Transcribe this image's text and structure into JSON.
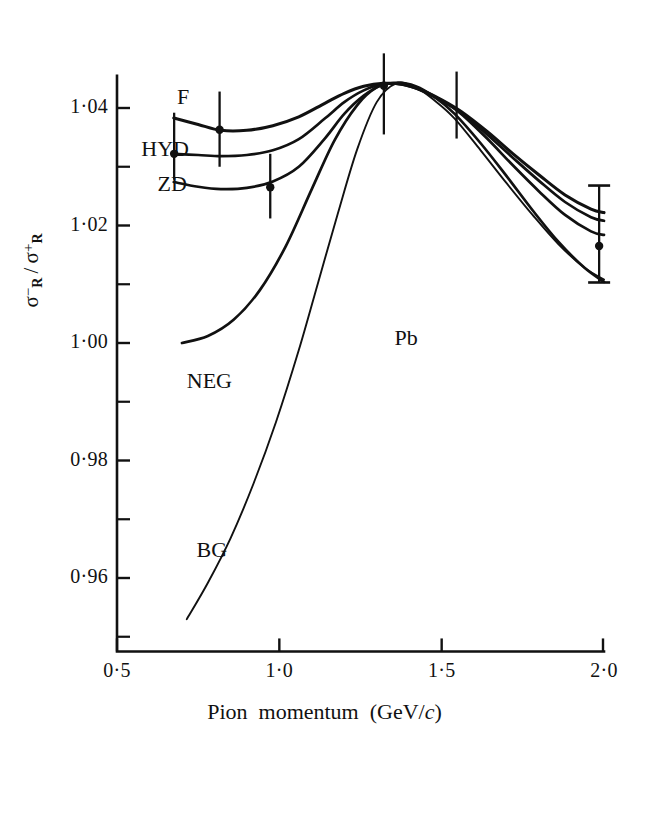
{
  "figure": {
    "target_label": "Pb",
    "y_axis_title_html": "σ⁻_R / σ⁺_R",
    "x_axis_title": "Pion momentum (GeV/c)"
  },
  "chart_data": {
    "type": "line",
    "title": "",
    "subtitle": "",
    "xlabel": "Pion momentum (GeV/c)",
    "ylabel": "σᴿ⁻ / σᴿ⁺",
    "xlim": [
      0.5,
      2.0
    ],
    "ylim": [
      0.9475,
      1.0455
    ],
    "grid": false,
    "legend": "inline-curve-labels",
    "annotations": [
      {
        "text": "Pb",
        "x": 1.355,
        "y": 1.0005
      },
      {
        "text": "F",
        "x": 0.685,
        "y": 1.0415
      },
      {
        "text": "HYD",
        "x": 0.575,
        "y": 1.0326
      },
      {
        "text": "ZD",
        "x": 0.625,
        "y": 1.0268
      },
      {
        "text": "NEG",
        "x": 0.715,
        "y": 0.9932
      },
      {
        "text": "BG",
        "x": 0.745,
        "y": 0.9645
      }
    ],
    "x_ticks": [
      0.5,
      1.0,
      1.5,
      2.0
    ],
    "x_ticklabels": [
      "0·5",
      "1·0",
      "1·5",
      "2·0"
    ],
    "x_minor_ticks": [
      0.75,
      1.25,
      1.75
    ],
    "y_ticks": [
      0.96,
      0.98,
      1.0,
      1.02,
      1.04
    ],
    "y_ticklabels": [
      "0·96",
      "0·98",
      "1·00",
      "1·02",
      "1·04"
    ],
    "y_minor_ticks": [
      0.95,
      0.97,
      0.99,
      1.01,
      1.03
    ],
    "series": [
      {
        "name": "F",
        "style": "solid-heavy",
        "x": [
          0.675,
          0.75,
          0.82,
          0.9,
          0.98,
          1.06,
          1.14,
          1.2,
          1.26,
          1.32,
          1.38,
          1.44,
          1.5,
          1.56,
          1.64,
          1.72,
          1.8,
          1.88,
          1.96,
          2.0
        ],
        "y": [
          1.0383,
          1.0372,
          1.0362,
          1.0362,
          1.037,
          1.0385,
          1.0408,
          1.0425,
          1.0437,
          1.0442,
          1.044,
          1.043,
          1.0414,
          1.0394,
          1.036,
          1.0322,
          1.0286,
          1.0252,
          1.0228,
          1.0222
        ]
      },
      {
        "name": "HYD",
        "style": "solid-med",
        "x": [
          0.675,
          0.75,
          0.82,
          0.9,
          0.98,
          1.06,
          1.14,
          1.2,
          1.26,
          1.32,
          1.38,
          1.44,
          1.5,
          1.56,
          1.64,
          1.72,
          1.8,
          1.88,
          1.96,
          2.0
        ],
        "y": [
          1.0322,
          1.032,
          1.0318,
          1.032,
          1.0328,
          1.0347,
          1.0382,
          1.041,
          1.043,
          1.0441,
          1.044,
          1.0429,
          1.0412,
          1.0392,
          1.0355,
          1.0315,
          1.0276,
          1.024,
          1.0214,
          1.0208
        ]
      },
      {
        "name": "ZD",
        "style": "solid-med",
        "x": [
          0.675,
          0.75,
          0.82,
          0.9,
          0.98,
          1.06,
          1.14,
          1.2,
          1.26,
          1.32,
          1.38,
          1.44,
          1.5,
          1.56,
          1.64,
          1.72,
          1.8,
          1.88,
          1.96,
          2.0
        ],
        "y": [
          1.0274,
          1.0266,
          1.0262,
          1.0264,
          1.0275,
          1.03,
          1.0348,
          1.039,
          1.0421,
          1.044,
          1.0441,
          1.043,
          1.0413,
          1.039,
          1.0348,
          1.0302,
          1.0258,
          1.0218,
          1.019,
          1.0184
        ]
      },
      {
        "name": "NEG",
        "style": "solid-med",
        "x": [
          0.7,
          0.78,
          0.86,
          0.94,
          1.02,
          1.1,
          1.17,
          1.24,
          1.3,
          1.36,
          1.42,
          1.48,
          1.54,
          1.62,
          1.7,
          1.78,
          1.86,
          1.94,
          2.0
        ],
        "y": [
          1.0,
          1.0012,
          1.004,
          1.009,
          1.0165,
          1.0262,
          1.0345,
          1.0405,
          1.0435,
          1.0443,
          1.0437,
          1.0418,
          1.039,
          1.034,
          1.0284,
          1.0226,
          1.0172,
          1.0128,
          1.0104
        ]
      },
      {
        "name": "BG",
        "style": "solid-thin",
        "x": [
          0.715,
          0.78,
          0.85,
          0.92,
          0.99,
          1.06,
          1.12,
          1.18,
          1.24,
          1.3,
          1.36,
          1.42,
          1.48,
          1.54,
          1.62,
          1.7,
          1.78,
          1.86,
          1.94,
          2.0
        ],
        "y": [
          0.953,
          0.9592,
          0.9668,
          0.976,
          0.9866,
          0.9988,
          1.0104,
          1.022,
          1.033,
          1.041,
          1.0442,
          1.0435,
          1.0412,
          1.0382,
          1.0328,
          1.0272,
          1.0218,
          1.0168,
          1.0128,
          1.0108
        ]
      }
    ],
    "data_points": [
      {
        "x": 0.676,
        "y": 1.0322,
        "yerr_low": 1.0278,
        "yerr_high": 1.0392,
        "marker": "filled-circle"
      },
      {
        "x": 0.816,
        "y": 1.0363,
        "yerr_low": 1.03,
        "yerr_high": 1.0428,
        "marker": "filled-circle"
      },
      {
        "x": 0.972,
        "y": 1.0265,
        "yerr_low": 1.0212,
        "yerr_high": 1.0322,
        "marker": "filled-circle"
      },
      {
        "x": 1.322,
        "y": 1.0438,
        "yerr_low": 1.0355,
        "yerr_high": 1.0493,
        "marker": "filled-circle"
      },
      {
        "x": 1.546,
        "y": 1.0398,
        "yerr_low": 1.0348,
        "yerr_high": 1.0462,
        "marker": "none"
      },
      {
        "x": 1.985,
        "y": 1.0165,
        "yerr_low": 1.0103,
        "yerr_high": 1.0268,
        "marker": "filled-circle"
      }
    ]
  }
}
